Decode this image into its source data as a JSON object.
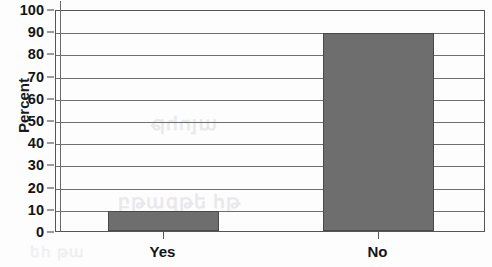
{
  "chart_data": {
    "type": "bar",
    "title": "",
    "xlabel": "",
    "ylabel": "Percent",
    "categories": [
      "Yes",
      "No"
    ],
    "values": [
      9,
      89
    ],
    "ylim": [
      0,
      100
    ],
    "yticks": [
      0,
      10,
      20,
      30,
      40,
      50,
      60,
      70,
      80,
      90,
      100
    ],
    "ytick_labels": [
      "0",
      "10",
      "20",
      "30",
      "40",
      "50",
      "60",
      "70",
      "80",
      "90",
      "100"
    ],
    "grid": true,
    "legend": null,
    "bar_color": "#6e6e6e",
    "bar_edge_color": "#4a4a4a",
    "gridline_color": "#6f6f6f",
    "axis_color": "#555555",
    "background_color": "#fdfdfd",
    "text_color": "#141414"
  },
  "artifacts": {
    "bleed_a": "բթազթե հթ",
    "bleed_b": "ալոհթ",
    "bleed_c": "եհ թա"
  }
}
